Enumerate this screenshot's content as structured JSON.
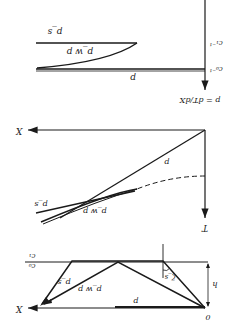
{
  "figure": {
    "orientation": "rotated-180",
    "colors": {
      "ink": "#1a1a1a",
      "background": "#ffffff"
    },
    "top_panel": {
      "labels": {
        "p_s": "p_s",
        "p_wp": "p_w p",
        "p": "p",
        "c1_inv": "c₁⁻¹",
        "c0_inv": "c₀⁻¹",
        "equation": "p = dT/dX"
      }
    },
    "middle_panel": {
      "labels": {
        "X": "X",
        "T": "T",
        "p": "p",
        "p_s": "p_s",
        "p_wp": "p_w p"
      }
    },
    "bottom_panel": {
      "labels": {
        "c1": "c₁",
        "c0": "c₀",
        "X": "X",
        "p": "p",
        "p_s": "p_s",
        "p_wp": "p_w p",
        "zeta_s": "ζ_s",
        "h": "h",
        "origin": "0"
      }
    }
  }
}
